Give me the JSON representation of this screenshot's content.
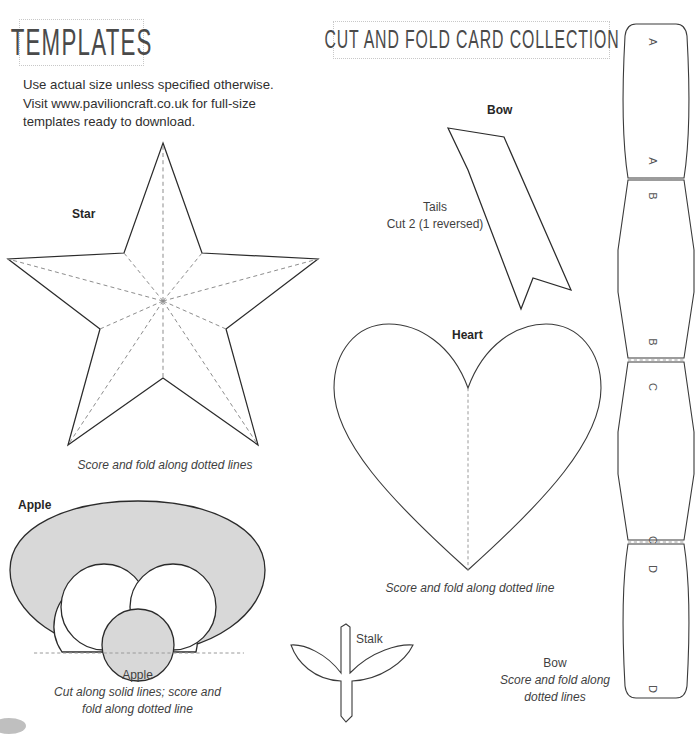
{
  "page": {
    "background": "#ffffff",
    "ink": "#2b2b2b",
    "gray_fill": "#d8d8d8",
    "dash_color": "#8d8d8d"
  },
  "headers": {
    "templates_title": "TEMPLATES",
    "collection_title": "CUT AND FOLD CARD COLLECTION"
  },
  "intro": {
    "line1": "Use actual size unless specified otherwise.",
    "line2": "Visit www.pavilioncraft.co.uk for full-size",
    "line3": "templates ready to download."
  },
  "star": {
    "label": "Star",
    "caption": "Score and fold along dotted lines"
  },
  "apple": {
    "label": "Apple",
    "caption_name": "Apple",
    "caption_line1": "Cut along solid lines; score and",
    "caption_line2": "fold along dotted line"
  },
  "tails": {
    "label": "Bow",
    "name": "Tails",
    "instruction": "Cut 2 (1 reversed)"
  },
  "heart": {
    "label": "Heart",
    "caption": "Score and fold along dotted line"
  },
  "stalk": {
    "label": "Stalk"
  },
  "bow_strip": {
    "caption_name": "Bow",
    "caption_line1": "Score and fold along",
    "caption_line2": "dotted lines",
    "segment_letters": [
      "A",
      "A",
      "B",
      "B",
      "C",
      "C",
      "D",
      "D"
    ]
  }
}
